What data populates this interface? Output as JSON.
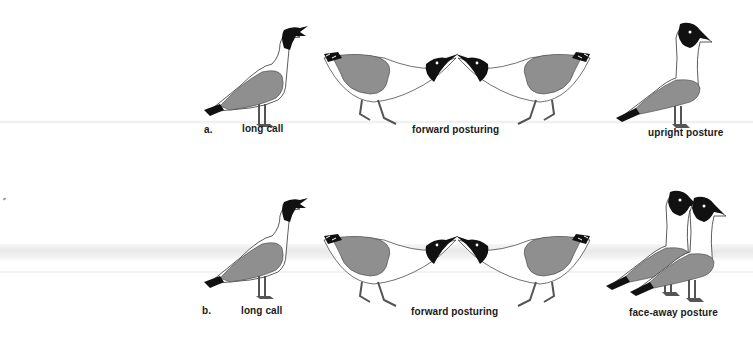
{
  "figure": {
    "domain_subject": "gull display postures",
    "colors": {
      "wing_gray": "#8f8f8f",
      "hood_black": "#111111",
      "outline": "#333333",
      "label_text": "#1a1a1a"
    },
    "rows": [
      {
        "marker": "a.",
        "panels": [
          {
            "label": "long call",
            "birds": 1,
            "pose": "head-up-calling"
          },
          {
            "label": "forward posturing",
            "birds": 2,
            "pose": "facing-forward-crouched"
          },
          {
            "label": "upright posture",
            "birds": 1,
            "pose": "upright"
          }
        ]
      },
      {
        "marker": "b.",
        "panels": [
          {
            "label": "long call",
            "birds": 1,
            "pose": "head-up-calling"
          },
          {
            "label": "forward posturing",
            "birds": 2,
            "pose": "facing-forward-crouched"
          },
          {
            "label": "face-away posture",
            "birds": 2,
            "pose": "face-away"
          }
        ]
      }
    ]
  }
}
